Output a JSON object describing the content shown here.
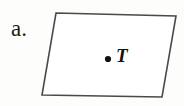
{
  "figure": {
    "part_label": "a.",
    "point_label": "T",
    "shape_name": "parallelogram",
    "stroke_color": "#4a4a4a",
    "fill_color": "#ffffff",
    "dot_color": "#111111",
    "background_color": "#fdfdfc",
    "vertices": [
      {
        "x": 56,
        "y": 13
      },
      {
        "x": 176,
        "y": 16
      },
      {
        "x": 162,
        "y": 97
      },
      {
        "x": 42,
        "y": 95
      }
    ],
    "point": {
      "x": 108,
      "y": 59,
      "radius": 3.1
    }
  }
}
